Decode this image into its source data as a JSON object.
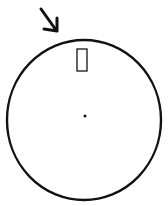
{
  "diagram": {
    "colors": {
      "stroke": "#111111",
      "background": "#ffffff"
    },
    "dial": {
      "cx": 84,
      "cy": 120,
      "rx": 77,
      "ry": 80,
      "stroke_width": 2.4
    },
    "indicator": {
      "x": 77,
      "y": 49,
      "width": 10,
      "height": 22,
      "stroke_width": 1.3
    },
    "center_dot": {
      "cx": 85,
      "cy": 116,
      "r": 1.5
    },
    "arrow": {
      "x1": 41,
      "y1": 9,
      "x2": 56,
      "y2": 30,
      "head": "arrow-head-down-right"
    }
  }
}
